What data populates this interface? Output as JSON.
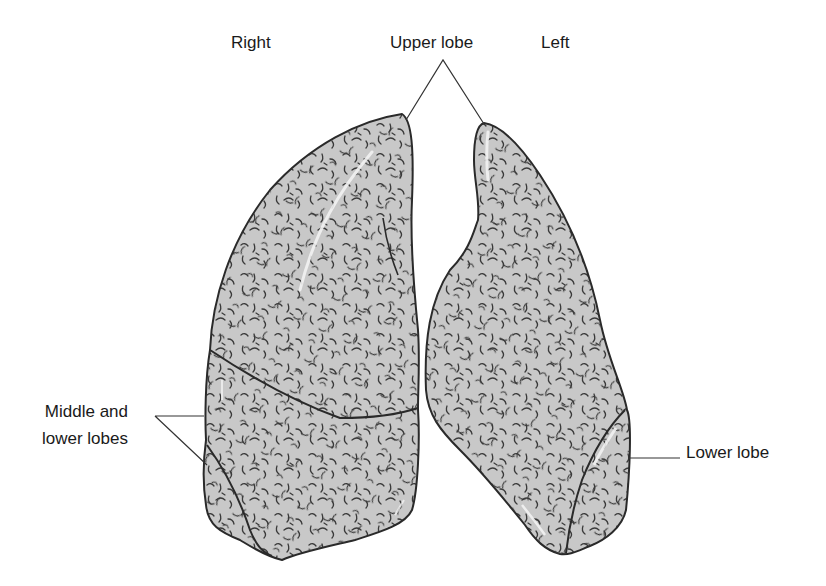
{
  "diagram": {
    "colors": {
      "lung_fill": "#c8c8c8",
      "outline": "#2a2a2a",
      "texture": "#3a3a3a",
      "highlight": "#f2f2f2",
      "leader_line": "#333333",
      "text": "#1a1a1a"
    },
    "labels": {
      "right": "Right",
      "upper_lobe": "Upper lobe",
      "left": "Left",
      "middle_lower_lobes": "Middle and\nlower lobes",
      "lower_lobe": "Lower lobe"
    },
    "structures": [
      {
        "id": "right-lung",
        "side": "Right",
        "lobes": [
          "Upper lobe",
          "Middle lobe",
          "Lower lobe"
        ]
      },
      {
        "id": "left-lung",
        "side": "Left",
        "lobes": [
          "Upper lobe",
          "Lower lobe"
        ]
      }
    ]
  }
}
